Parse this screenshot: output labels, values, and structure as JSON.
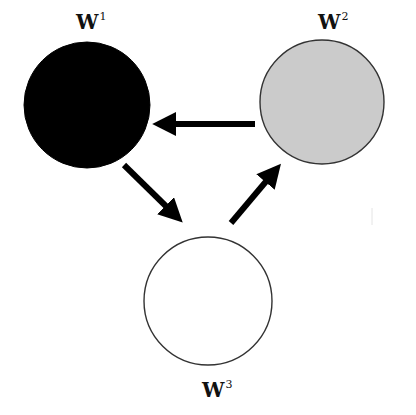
{
  "diagram": {
    "type": "cycle",
    "nodes": [
      {
        "id": "w1",
        "label_base": "W",
        "label_sup": "1",
        "fill": "#000000",
        "stroke": "#000000",
        "cx": 87,
        "cy": 105,
        "r": 63
      },
      {
        "id": "w2",
        "label_base": "W",
        "label_sup": "2",
        "fill": "#cbcbcb",
        "stroke": "#333333",
        "cx": 322,
        "cy": 102,
        "r": 62
      },
      {
        "id": "w3",
        "label_base": "W",
        "label_sup": "3",
        "fill": "#ffffff",
        "stroke": "#333333",
        "cx": 208,
        "cy": 301,
        "r": 64
      }
    ],
    "edges": [
      {
        "from": "w2",
        "to": "w1",
        "direction": "left"
      },
      {
        "from": "w1",
        "to": "w3",
        "direction": "down-right"
      },
      {
        "from": "w3",
        "to": "w2",
        "direction": "up-right"
      }
    ],
    "colors": {
      "arrow": "#000000",
      "background": "#ffffff"
    }
  }
}
